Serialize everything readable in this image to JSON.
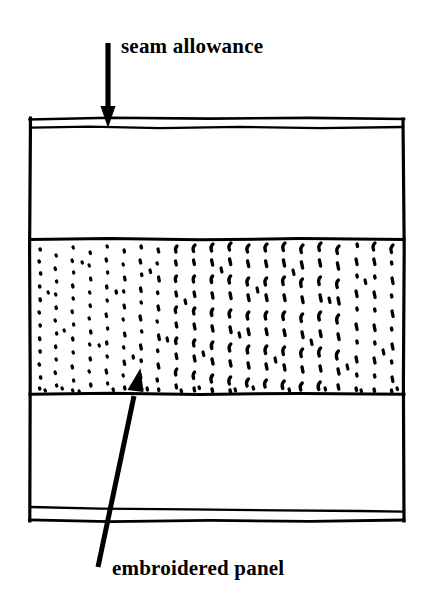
{
  "figure": {
    "kind": "sewing-pattern-diagram",
    "background_color": "#ffffff",
    "ink_color": "#000000"
  },
  "labels": {
    "seam_allowance": "seam allowance",
    "embroidered_panel": "embroidered panel"
  },
  "annotations": [
    {
      "name": "seam-allowance-arrow",
      "label": "seam allowance",
      "direction": "down",
      "from": [
        108,
        43
      ],
      "to": [
        108,
        126
      ]
    },
    {
      "name": "embroidered-panel-arrow",
      "label": "embroidered panel",
      "direction": "up-right",
      "from": [
        98,
        567
      ],
      "to": [
        140,
        371
      ]
    }
  ],
  "fabric": {
    "name": "fabric-rectangle",
    "left": 29,
    "right": 404,
    "top": 118,
    "bottom": 521,
    "bands": [
      {
        "name": "top-seam-allowance-band",
        "label": "seam allowance",
        "top": 118,
        "bottom": 128,
        "fill": "plain"
      },
      {
        "name": "upper-plain-panel",
        "label": "",
        "top": 128,
        "bottom": 239,
        "fill": "plain"
      },
      {
        "name": "embroidered-panel-band",
        "label": "embroidered panel",
        "top": 239,
        "bottom": 394,
        "fill": "stitch-texture"
      },
      {
        "name": "lower-plain-panel",
        "label": "",
        "top": 394,
        "bottom": 508,
        "fill": "plain"
      },
      {
        "name": "bottom-seam-allowance-band",
        "label": "seam allowance",
        "top": 508,
        "bottom": 521,
        "fill": "plain"
      }
    ]
  },
  "texture": {
    "name": "embroidery-stitch-texture",
    "style": "vertical columns of short hand-drawn dashes and dots",
    "column_spacing_px": 20,
    "density_note": "fine dots on the left, longer dashes toward the right"
  }
}
